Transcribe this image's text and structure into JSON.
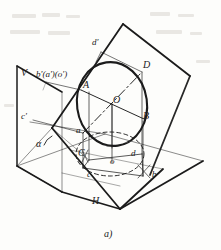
{
  "figure": {
    "caption": "a)",
    "background_color": "#fdfdfb",
    "ink_color": "#1b1b1b",
    "planes": {
      "vertical_label": "V",
      "horizontal_label": "H"
    },
    "angle_label": "α",
    "space_points": [
      {
        "id": "A",
        "label": "A",
        "x": 89,
        "y": 86
      },
      {
        "id": "B",
        "label": "B",
        "x": 146,
        "y": 117
      },
      {
        "id": "C",
        "label": "C",
        "x": 77,
        "y": 145
      },
      {
        "id": "D",
        "label": "D",
        "x": 145,
        "y": 66
      },
      {
        "id": "O",
        "label": "O",
        "x": 115,
        "y": 100
      }
    ],
    "horizontal_projections": [
      {
        "id": "a",
        "label": "a",
        "x": 79,
        "y": 131
      },
      {
        "id": "b",
        "label": "b",
        "x": 155,
        "y": 176
      },
      {
        "id": "c",
        "label": "c",
        "x": 90,
        "y": 173
      },
      {
        "id": "d",
        "label": "d",
        "x": 133,
        "y": 155
      },
      {
        "id": "o",
        "label": "o",
        "x": 113,
        "y": 163
      }
    ],
    "vertical_projections": [
      {
        "id": "d-prime",
        "label": "d'",
        "x": 95,
        "y": 44
      },
      {
        "id": "c-prime",
        "label": "c'",
        "x": 24,
        "y": 119
      },
      {
        "id": "b-a-o-prime",
        "label": "b'(a')(o')",
        "x": 37,
        "y": 75
      }
    ],
    "circle": {
      "center_x": 112,
      "center_y": 104,
      "radius_x": 35,
      "radius_y": 42,
      "rotation_deg": -8
    },
    "ellipse_projection": {
      "center_x": 110,
      "center_y": 154,
      "radius_x": 34,
      "radius_y": 22,
      "style": "dashed"
    }
  }
}
